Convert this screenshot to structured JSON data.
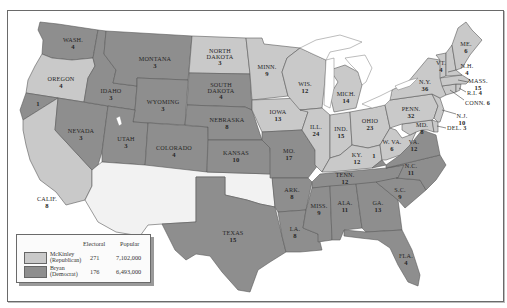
{
  "map": {
    "title": "",
    "colors": {
      "mckinley_republican": "#c9c9c9",
      "bryan_democrat": "#8e8e8e",
      "territory_unassigned": "#f2f2f2",
      "water": "#ffffff"
    },
    "states": [
      {
        "id": "wash",
        "label": "WASH.",
        "votes": "4",
        "party": "democrat"
      },
      {
        "id": "oregon",
        "label": "OREGON",
        "votes": "4",
        "party": "republican"
      },
      {
        "id": "calif",
        "label": "CALIF.",
        "votes": "8",
        "party": "republican"
      },
      {
        "id": "calif-split",
        "label": "",
        "votes": "1",
        "party": "democrat"
      },
      {
        "id": "nevada",
        "label": "NEVADA",
        "votes": "3",
        "party": "democrat"
      },
      {
        "id": "idaho",
        "label": "IDAHO",
        "votes": "3",
        "party": "democrat"
      },
      {
        "id": "montana",
        "label": "MONTANA",
        "votes": "3",
        "party": "democrat"
      },
      {
        "id": "wyoming",
        "label": "WYOMING",
        "votes": "3",
        "party": "democrat"
      },
      {
        "id": "utah",
        "label": "UTAH",
        "votes": "3",
        "party": "democrat"
      },
      {
        "id": "colorado",
        "label": "COLORADO",
        "votes": "4",
        "party": "democrat"
      },
      {
        "id": "north-dakota",
        "label": "NORTH DAKOTA",
        "votes": "3",
        "party": "republican"
      },
      {
        "id": "south-dakota",
        "label": "SOUTH DAKOTA",
        "votes": "4",
        "party": "democrat"
      },
      {
        "id": "nebraska",
        "label": "NEBRASKA",
        "votes": "8",
        "party": "democrat"
      },
      {
        "id": "kansas",
        "label": "KANSAS",
        "votes": "10",
        "party": "democrat"
      },
      {
        "id": "texas",
        "label": "TEXAS",
        "votes": "15",
        "party": "democrat"
      },
      {
        "id": "minn",
        "label": "MINN.",
        "votes": "9",
        "party": "republican"
      },
      {
        "id": "iowa",
        "label": "IOWA",
        "votes": "13",
        "party": "republican"
      },
      {
        "id": "mo",
        "label": "MO.",
        "votes": "17",
        "party": "democrat"
      },
      {
        "id": "ark",
        "label": "ARK.",
        "votes": "8",
        "party": "democrat"
      },
      {
        "id": "la",
        "label": "LA.",
        "votes": "8",
        "party": "democrat"
      },
      {
        "id": "wis",
        "label": "WIS.",
        "votes": "12",
        "party": "republican"
      },
      {
        "id": "ill",
        "label": "ILL.",
        "votes": "24",
        "party": "republican"
      },
      {
        "id": "mich",
        "label": "MICH.",
        "votes": "14",
        "party": "republican"
      },
      {
        "id": "ind",
        "label": "IND.",
        "votes": "15",
        "party": "republican"
      },
      {
        "id": "ohio",
        "label": "OHIO",
        "votes": "23",
        "party": "republican"
      },
      {
        "id": "ky",
        "label": "KY.",
        "votes": "12",
        "party": "republican"
      },
      {
        "id": "ky-split",
        "label": "",
        "votes": "1",
        "party": "democrat"
      },
      {
        "id": "tenn",
        "label": "TENN.",
        "votes": "12",
        "party": "democrat"
      },
      {
        "id": "miss",
        "label": "MISS.",
        "votes": "9",
        "party": "democrat"
      },
      {
        "id": "ala",
        "label": "ALA.",
        "votes": "11",
        "party": "democrat"
      },
      {
        "id": "ga",
        "label": "GA.",
        "votes": "13",
        "party": "democrat"
      },
      {
        "id": "fla",
        "label": "FLA.",
        "votes": "4",
        "party": "democrat"
      },
      {
        "id": "sc",
        "label": "S.C.",
        "votes": "9",
        "party": "democrat"
      },
      {
        "id": "nc",
        "label": "N.C.",
        "votes": "11",
        "party": "democrat"
      },
      {
        "id": "va",
        "label": "VA.",
        "votes": "12",
        "party": "democrat"
      },
      {
        "id": "w-va",
        "label": "W. VA.",
        "votes": "6",
        "party": "republican"
      },
      {
        "id": "md",
        "label": "MD.",
        "votes": "8",
        "party": "republican"
      },
      {
        "id": "del",
        "label": "DEL.",
        "votes": "3",
        "party": "republican"
      },
      {
        "id": "nj",
        "label": "N.J.",
        "votes": "10",
        "party": "republican"
      },
      {
        "id": "penn",
        "label": "PENN.",
        "votes": "32",
        "party": "republican"
      },
      {
        "id": "ny",
        "label": "N.Y.",
        "votes": "36",
        "party": "republican"
      },
      {
        "id": "conn",
        "label": "CONN.",
        "votes": "6",
        "party": "republican"
      },
      {
        "id": "ri",
        "label": "R.I.",
        "votes": "4",
        "party": "republican"
      },
      {
        "id": "mass",
        "label": "MASS.",
        "votes": "15",
        "party": "republican"
      },
      {
        "id": "vt",
        "label": "VT.",
        "votes": "4",
        "party": "republican"
      },
      {
        "id": "nh",
        "label": "N.H.",
        "votes": "4",
        "party": "republican"
      },
      {
        "id": "me",
        "label": "ME.",
        "votes": "6",
        "party": "republican"
      }
    ]
  },
  "legend": {
    "headers": {
      "electoral": "Electoral",
      "popular": "Popular"
    },
    "rows": [
      {
        "name": "McKinley",
        "party": "(Republican)",
        "electoral": "271",
        "popular": "7,102,000",
        "color": "#c9c9c9"
      },
      {
        "name": "Bryan",
        "party": "(Democrat)",
        "electoral": "176",
        "popular": "6,493,000",
        "color": "#8e8e8e"
      }
    ]
  }
}
